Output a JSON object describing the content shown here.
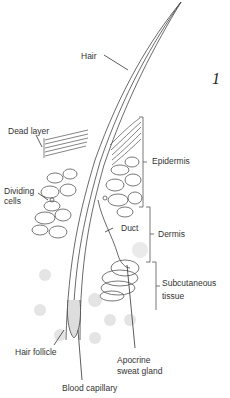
{
  "figure_number": "1",
  "labels": {
    "hair": "Hair",
    "dead_layer": "Dead layer",
    "epidermis": "Epidermis",
    "dividing_cells_1": "Dividing",
    "dividing_cells_2": "cells",
    "duct": "Duct",
    "dermis": "Dermis",
    "subcutaneous_1": "Subcutaneous",
    "subcutaneous_2": "tissue",
    "hair_follicle": "Hair follicle",
    "apocrine_1": "Apocrine",
    "apocrine_2": "sweat gland",
    "blood_capillary": "Blood capillary"
  }
}
